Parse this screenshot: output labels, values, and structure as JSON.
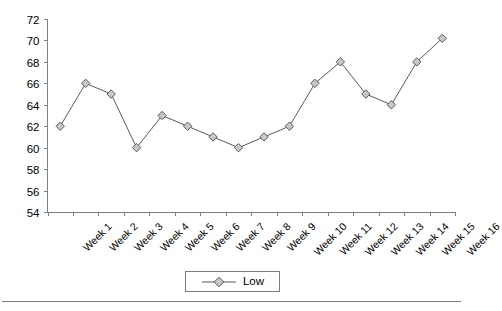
{
  "chart_data": {
    "type": "line",
    "title": "",
    "subtitle": "",
    "xlabel": "",
    "ylabel": "",
    "categories": [
      "Week 1",
      "Week 2",
      "Week 3",
      "Week 4",
      "Week 5",
      "Week 6",
      "Week 7",
      "Week 8",
      "Week 9",
      "Week 10",
      "Week 11",
      "Week 12",
      "Week 13",
      "Week 14",
      "Week 15",
      "Week 16"
    ],
    "series": [
      {
        "name": "Low",
        "values": [
          62,
          66,
          65,
          60,
          63,
          62,
          61,
          60,
          61,
          62,
          66,
          68,
          65,
          64,
          68,
          70.2
        ],
        "line_color": "#595959",
        "marker": "diamond",
        "marker_fill": "#c8c8c8",
        "marker_stroke": "#5a5a5a"
      }
    ],
    "ylim": [
      54,
      72
    ],
    "ytick_step": 2,
    "yticks": [
      54,
      56,
      58,
      60,
      62,
      64,
      66,
      68,
      70,
      72
    ],
    "ytick_labels": [
      "54",
      "56",
      "58",
      "60",
      "62",
      "64",
      "66",
      "68",
      "70",
      "72"
    ],
    "grid": false,
    "legend": {
      "position": "bottom-center",
      "entries": [
        {
          "label": "Low"
        }
      ]
    },
    "annotations": []
  },
  "legend": {
    "low_label": "Low"
  }
}
